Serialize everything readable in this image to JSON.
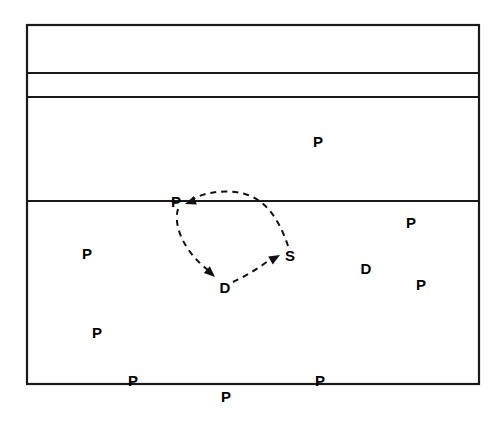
{
  "figure": {
    "kind": "field-diagram",
    "background_color": "#ffffff",
    "stroke_color": "#1a1a1a",
    "label_color": "#000000",
    "width": 504,
    "height": 427
  },
  "court": {
    "outline": {
      "left": 27,
      "top": 25,
      "right": 479,
      "bottom": 384,
      "stroke_width": 2.2
    },
    "lines": [
      {
        "name": "upper-line-1",
        "y": 73,
        "x1": 27,
        "x2": 479,
        "stroke_width": 1.8
      },
      {
        "name": "upper-line-2",
        "y": 97,
        "x1": 27,
        "x2": 479,
        "stroke_width": 1.8
      },
      {
        "name": "mid-line",
        "y": 201,
        "x1": 27,
        "x2": 479,
        "stroke_width": 1.8
      }
    ]
  },
  "player_markers": [
    {
      "id": "p-upper-zone",
      "label": "P",
      "x": 318,
      "y": 141
    },
    {
      "id": "p-movement-origin",
      "label": "P",
      "x": 176,
      "y": 201
    },
    {
      "id": "p-right-upper",
      "label": "P",
      "x": 411,
      "y": 222
    },
    {
      "id": "p-left-mid",
      "label": "P",
      "x": 87,
      "y": 253
    },
    {
      "id": "s-setter",
      "label": "S",
      "x": 290,
      "y": 255
    },
    {
      "id": "d-right",
      "label": "D",
      "x": 366,
      "y": 268
    },
    {
      "id": "d-movement-target",
      "label": "D",
      "x": 225,
      "y": 287
    },
    {
      "id": "p-right-lower",
      "label": "P",
      "x": 421,
      "y": 284
    },
    {
      "id": "p-left-lower",
      "label": "P",
      "x": 97,
      "y": 332
    },
    {
      "id": "p-baseline-left",
      "label": "P",
      "x": 133,
      "y": 380
    },
    {
      "id": "p-baseline-right",
      "label": "P",
      "x": 320,
      "y": 380
    },
    {
      "id": "p-below-baseline",
      "label": "P",
      "x": 226,
      "y": 396
    }
  ],
  "movement_arrows": [
    {
      "id": "arrow-p-to-d",
      "from": "P",
      "to": "D",
      "style": "dashed",
      "path": "M 178 209 C 172 230 190 258 211 272",
      "arrowhead": {
        "x": 214,
        "y": 276,
        "angle": 42
      }
    },
    {
      "id": "arrow-d-to-s",
      "from": "D",
      "to": "S",
      "style": "dashed",
      "path": "M 233 282 C 246 276 262 266 272 258",
      "arrowhead": {
        "x": 277,
        "y": 256,
        "angle": -28
      }
    },
    {
      "id": "arrow-s-to-p",
      "from": "S",
      "to": "P",
      "style": "dashed",
      "path": "M 288 246 C 280 224 268 200 243 194 C 221 189 200 194 191 200",
      "arrowhead": {
        "x": 186,
        "y": 203,
        "angle": 160
      }
    }
  ],
  "dash_pattern": "6,5",
  "arrow_stroke_width": 2.0
}
